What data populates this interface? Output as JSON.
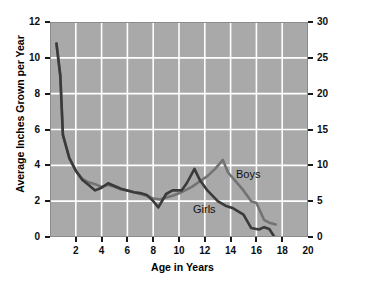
{
  "chart_data": {
    "type": "line",
    "title": "",
    "xlabel": "Age in Years",
    "ylabel": "Average Inches Grown per Year",
    "y2label": "Average Centimeters Grown per Year",
    "xlim": [
      0,
      20
    ],
    "ylim": [
      0,
      12
    ],
    "y2lim": [
      0,
      30
    ],
    "xticks": [
      0,
      2,
      4,
      6,
      8,
      10,
      12,
      14,
      16,
      18,
      20
    ],
    "xtick_labels": [
      "",
      "2",
      "4",
      "6",
      "8",
      "10",
      "12",
      "14",
      "16",
      "18",
      "20"
    ],
    "yticks": [
      0,
      2,
      4,
      6,
      8,
      10,
      12
    ],
    "ytick_labels": [
      "0",
      "2",
      "4",
      "6",
      "8",
      "10",
      "12"
    ],
    "y2ticks": [
      0,
      5,
      10,
      15,
      20,
      25,
      30
    ],
    "y2tick_labels": [
      "0",
      "5",
      "10",
      "15",
      "20",
      "25",
      "30"
    ],
    "grid": true,
    "grid_color": "#ffffff",
    "plot_background": "#a9a9a9",
    "legend_position": "inline-annotations",
    "series": [
      {
        "name": "Girls",
        "color": "#3a3a3a",
        "label_text": "Girls",
        "points": [
          [
            0.5,
            10.8
          ],
          [
            0.8,
            9.0
          ],
          [
            1.0,
            5.7
          ],
          [
            1.5,
            4.4
          ],
          [
            2.0,
            3.7
          ],
          [
            2.5,
            3.2
          ],
          [
            3.0,
            2.9
          ],
          [
            3.5,
            2.6
          ],
          [
            4.0,
            2.75
          ],
          [
            4.5,
            3.0
          ],
          [
            5.0,
            2.85
          ],
          [
            5.5,
            2.7
          ],
          [
            6.0,
            2.6
          ],
          [
            6.5,
            2.5
          ],
          [
            7.0,
            2.45
          ],
          [
            7.5,
            2.35
          ],
          [
            8.0,
            2.0
          ],
          [
            8.4,
            1.65
          ],
          [
            9.0,
            2.4
          ],
          [
            9.5,
            2.6
          ],
          [
            10.2,
            2.6
          ],
          [
            10.6,
            3.0
          ],
          [
            11.2,
            3.8
          ],
          [
            11.6,
            3.2
          ],
          [
            12.2,
            2.6
          ],
          [
            13.0,
            2.0
          ],
          [
            13.6,
            1.75
          ],
          [
            14.2,
            1.6
          ],
          [
            15.0,
            1.25
          ],
          [
            15.6,
            0.5
          ],
          [
            16.2,
            0.42
          ],
          [
            16.6,
            0.55
          ],
          [
            17.0,
            0.45
          ],
          [
            17.4,
            0.0
          ]
        ]
      },
      {
        "name": "Boys",
        "color": "#737373",
        "label_text": "Boys",
        "points": [
          [
            0.5,
            10.8
          ],
          [
            0.8,
            9.0
          ],
          [
            1.0,
            5.7
          ],
          [
            1.5,
            4.4
          ],
          [
            2.0,
            3.7
          ],
          [
            2.5,
            3.25
          ],
          [
            3.0,
            3.05
          ],
          [
            3.5,
            2.95
          ],
          [
            4.0,
            2.8
          ],
          [
            4.5,
            2.9
          ],
          [
            5.0,
            2.8
          ],
          [
            5.5,
            2.65
          ],
          [
            6.0,
            2.6
          ],
          [
            6.5,
            2.5
          ],
          [
            7.0,
            2.4
          ],
          [
            7.5,
            2.3
          ],
          [
            8.0,
            2.15
          ],
          [
            8.5,
            2.1
          ],
          [
            9.0,
            2.2
          ],
          [
            9.5,
            2.3
          ],
          [
            10.2,
            2.5
          ],
          [
            11.0,
            2.8
          ],
          [
            11.6,
            3.1
          ],
          [
            12.2,
            3.4
          ],
          [
            12.8,
            3.8
          ],
          [
            13.4,
            4.3
          ],
          [
            13.8,
            3.6
          ],
          [
            14.4,
            3.1
          ],
          [
            15.0,
            2.6
          ],
          [
            15.6,
            2.0
          ],
          [
            16.0,
            1.9
          ],
          [
            16.6,
            0.95
          ],
          [
            17.0,
            0.8
          ],
          [
            17.5,
            0.7
          ]
        ]
      }
    ]
  },
  "labels": {
    "x_axis_title": "Age in Years",
    "y_axis_left_title": "Average Inches Grown per Year",
    "y_axis_right_title": "Average Centimeters Grown per Year",
    "boys": "Boys",
    "girls": "Girls"
  }
}
